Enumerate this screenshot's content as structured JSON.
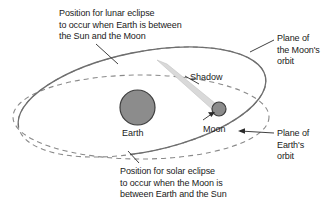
{
  "diagram": {
    "colors": {
      "background": "#ffffff",
      "orbit_line": "#8a8a8a",
      "body_fill": "#8c8c8c",
      "body_stroke": "#3d3d3d",
      "shadow_fill": "#d9d9d9",
      "text": "#1a1a1a",
      "leader_line": "#2b2b2b"
    },
    "labels": {
      "lunar_eclipse": "Position for lunar eclipse\nto occur when Earth is between\nthe Sun and the Moon",
      "solar_eclipse": "Position for solar eclipse\nto occur when the Moon is\nbetween Earth and the Sun",
      "plane_moon_orbit": "Plane of\nthe Moon's\norbit",
      "plane_earth_orbit": "Plane of\nEarth's\norbit",
      "shadow": "Shadow",
      "earth": "Earth",
      "moon": "Moon"
    },
    "bodies": [
      {
        "name": "earth",
        "label": "Earth",
        "cx": 137.5,
        "cy": 107.5,
        "r": 17.5
      },
      {
        "name": "moon",
        "label": "Moon",
        "cx": 219,
        "cy": 109,
        "r": 7
      }
    ],
    "orbits": [
      {
        "name": "moons-orbit-plane",
        "style": "tilted ellipse, solid front arc, dashed back arc"
      },
      {
        "name": "earths-orbit-plane",
        "style": "horizontal ellipse, fully dashed"
      }
    ],
    "shadow": {
      "name": "earth-shadow-cone",
      "description": "Cone of shadow narrowing from upper left toward the Moon"
    }
  }
}
